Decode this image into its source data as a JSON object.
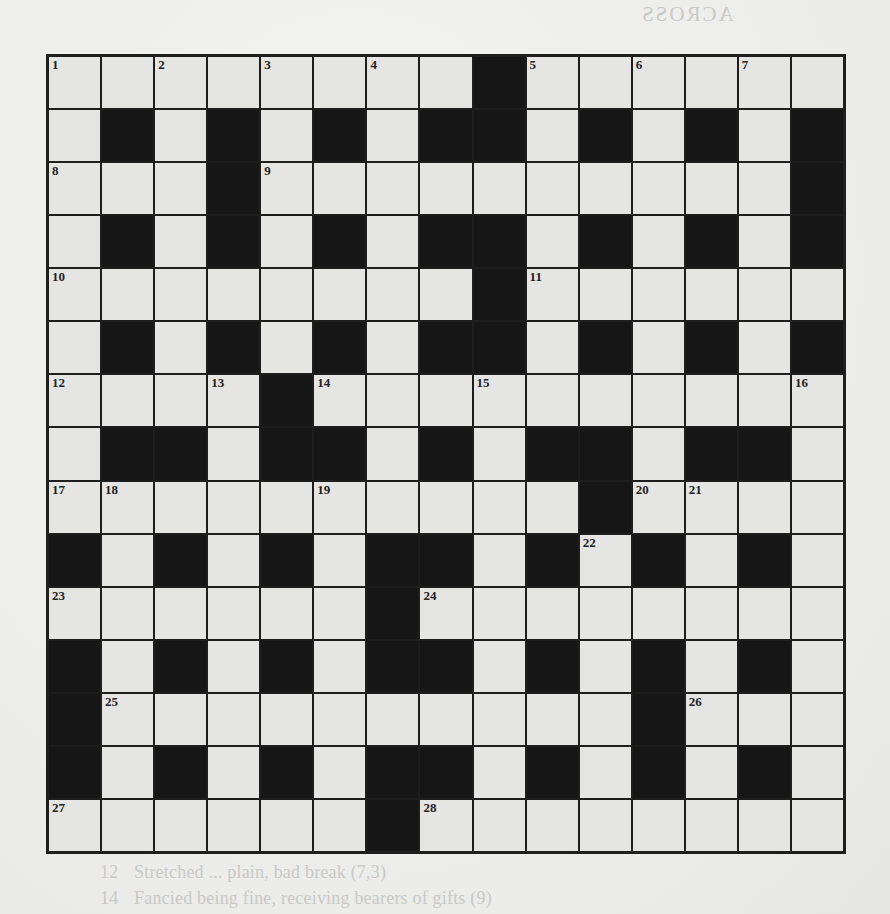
{
  "puzzle": {
    "rows": 15,
    "cols": 15,
    "colors": {
      "black_cell": "#161616",
      "white_cell": "#f4f4f2",
      "grid_line": "#1e1e1e",
      "paper": "#efefed",
      "show_through_text": "#c9c9c6"
    },
    "layout": [
      "WWWWWWWWBWWWWWW",
      "WBWBWBWBBWBWBWB",
      "WWWBWWWWWWWWWWB",
      "WBWBWBWBBWBWBWB",
      "WWWWWWWWBWWWWWW",
      "WBWBWBWBBWBWBWB",
      "WWWWBWWWWWWWWWW",
      "WBBWBBWBWBBWBBW",
      "WWWWWWWWWWBWWWW",
      "BWBWBWBBWBWBWBW",
      "WWWWWWBWWWWWWWW",
      "BWBWBWBBWBWBWBW",
      "BWWWWWWWWWWBWWW",
      "BWBWBWBBWBWBWBW",
      "WWWWWWBWWWWWWWW"
    ],
    "numbers": [
      {
        "row": 0,
        "col": 0,
        "n": "1"
      },
      {
        "row": 0,
        "col": 2,
        "n": "2"
      },
      {
        "row": 0,
        "col": 4,
        "n": "3"
      },
      {
        "row": 0,
        "col": 6,
        "n": "4"
      },
      {
        "row": 0,
        "col": 9,
        "n": "5"
      },
      {
        "row": 0,
        "col": 11,
        "n": "6"
      },
      {
        "row": 0,
        "col": 13,
        "n": "7"
      },
      {
        "row": 2,
        "col": 0,
        "n": "8"
      },
      {
        "row": 2,
        "col": 4,
        "n": "9"
      },
      {
        "row": 4,
        "col": 0,
        "n": "10"
      },
      {
        "row": 4,
        "col": 9,
        "n": "11"
      },
      {
        "row": 6,
        "col": 0,
        "n": "12"
      },
      {
        "row": 6,
        "col": 3,
        "n": "13"
      },
      {
        "row": 6,
        "col": 5,
        "n": "14"
      },
      {
        "row": 6,
        "col": 8,
        "n": "15"
      },
      {
        "row": 6,
        "col": 14,
        "n": "16"
      },
      {
        "row": 8,
        "col": 0,
        "n": "17"
      },
      {
        "row": 8,
        "col": 1,
        "n": "18"
      },
      {
        "row": 8,
        "col": 5,
        "n": "19"
      },
      {
        "row": 8,
        "col": 11,
        "n": "20"
      },
      {
        "row": 8,
        "col": 12,
        "n": "21"
      },
      {
        "row": 9,
        "col": 10,
        "n": "22"
      },
      {
        "row": 10,
        "col": 0,
        "n": "23"
      },
      {
        "row": 10,
        "col": 7,
        "n": "24"
      },
      {
        "row": 12,
        "col": 1,
        "n": "25"
      },
      {
        "row": 12,
        "col": 12,
        "n": "26"
      },
      {
        "row": 14,
        "col": 0,
        "n": "27"
      },
      {
        "row": 14,
        "col": 7,
        "n": "28"
      }
    ]
  },
  "show_through": {
    "across_heading": "ACROSS",
    "down_heading": "DOWN",
    "across": [
      {
        "num": "1",
        "text": "...but applied ... in cove ... (7)"
      },
      {
        "num": "6",
        "text": "...que needed by country musician ... (6)"
      },
      {
        "num": "",
        "text": "...asks ... arrival ... cap ... fra... the"
      },
      {
        "num": "",
        "text": "...ince ... (4)"
      },
      {
        "num": "",
        "text": "...ench author working as judge (9)"
      },
      {
        "num": "",
        "text": "...erzy ... unnoticeable ... (5)"
      },
      {
        "num": "",
        "text": "...wo ... d ... inkling ... contracted ... (10)"
      },
      {
        "num": "",
        "text": "...sewhere ... (4)"
      },
      {
        "num": "16",
        "text": "People generally understood by country (6)"
      },
      {
        "num": "",
        "text": "...ics ... ts ... nick ... (5)"
      },
      {
        "num": "",
        "text": "...Whiting ... eloquent ... (7)"
      },
      {
        "num": "22",
        "text": "...ower ... devil (6)"
      },
      {
        "num": "23",
        "text": "...aerial ... ence, ... ordinance? That ... (7)"
      },
      {
        "num": "25",
        "text": "...as ... out ... the ... (6)"
      },
      {
        "num": "28",
        "text": "..."
      }
    ],
    "down": [
      {
        "num": "2",
        "text": "...about ... doctor ... (7)"
      },
      {
        "num": "3",
        "text": "...p ... (4)"
      },
      {
        "num": "4",
        "text": "...Nothing ... in this language (7)"
      },
      {
        "num": "5",
        "text": "...old ... (8)"
      },
      {
        "num": "6",
        "text": "...a ... in C ... alf ... (7)"
      },
      {
        "num": "7",
        "text": "...Almost excessively ... (9)"
      },
      {
        "num": "8",
        "text": "...ral ... its ... much ... (7)"
      },
      {
        "num": "12",
        "text": "Stretched ... plain, bad break (7,3)"
      },
      {
        "num": "14",
        "text": "Fancied being fine, receiving bearers of gifts (9)"
      }
    ]
  }
}
